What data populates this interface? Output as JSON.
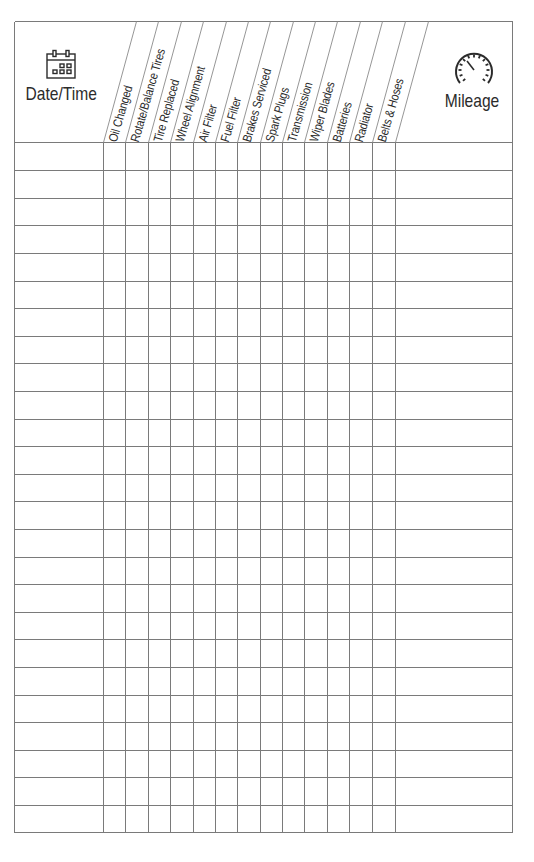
{
  "log": {
    "date_column": {
      "label": "Date/Time",
      "icon": "calendar-icon"
    },
    "mileage_column": {
      "label": "Mileage",
      "icon": "speedometer-icon"
    },
    "service_columns": [
      {
        "label": "Oil Changed"
      },
      {
        "label": "Rotate/Balance Tires"
      },
      {
        "label": "Tire Replaced"
      },
      {
        "label": "Wheel Alignment"
      },
      {
        "label": "Air Filter"
      },
      {
        "label": "Fuel Filter"
      },
      {
        "label": "Brakes Serviced"
      },
      {
        "label": "Spark Plugs"
      },
      {
        "label": "Transmission"
      },
      {
        "label": "Wiper Blades"
      },
      {
        "label": "Batteries"
      },
      {
        "label": "Radiator"
      },
      {
        "label": "Belts & Hoses"
      }
    ],
    "row_count": 25,
    "rows": []
  },
  "colors": {
    "line": "#7a7a7a",
    "text": "#2b2b2b",
    "background": "#ffffff"
  }
}
